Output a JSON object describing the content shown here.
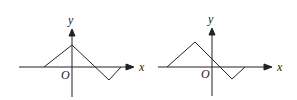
{
  "graphs": [
    {
      "axis_labels": {
        "x": "x",
        "y": "y",
        "origin": "O"
      },
      "polyline": [
        [
          44,
          67
        ],
        [
          72,
          45
        ],
        [
          109,
          80
        ],
        [
          121,
          67
        ]
      ]
    },
    {
      "axis_labels": {
        "x": "x",
        "y": "y",
        "origin": "O"
      },
      "polyline": [
        [
          167,
          67
        ],
        [
          195,
          42
        ],
        [
          232,
          79
        ],
        [
          245,
          67
        ]
      ]
    }
  ],
  "colors": {
    "stroke": "#222222"
  }
}
